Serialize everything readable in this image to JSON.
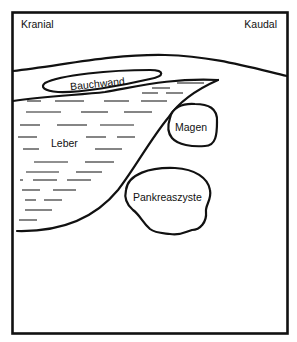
{
  "diagram": {
    "orientation": {
      "left": "Kranial",
      "right": "Kaudal"
    },
    "structures": {
      "abdominal_wall": "Bauchwand",
      "liver": "Leber",
      "stomach": "Magen",
      "pancreatic_cyst": "Pankreaszyste"
    },
    "colors": {
      "stroke": "#111111",
      "background": "#ffffff"
    }
  }
}
